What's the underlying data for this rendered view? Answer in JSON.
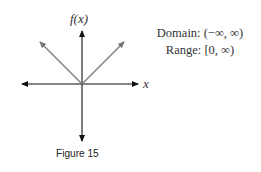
{
  "figure": {
    "caption": "Figure 15",
    "y_axis_label": "f(x)",
    "x_axis_label": "x",
    "domain_text": "Domain: (−∞, ∞)",
    "range_text": "Range: [0, ∞)"
  },
  "colors": {
    "axes": "#111111",
    "graph": "#777777",
    "background": "#ffffff"
  },
  "graph": {
    "function": "absolute value, vertex at origin",
    "vertex": [
      0,
      0
    ],
    "left_branch_direction": "up-left",
    "right_branch_direction": "up-right"
  }
}
